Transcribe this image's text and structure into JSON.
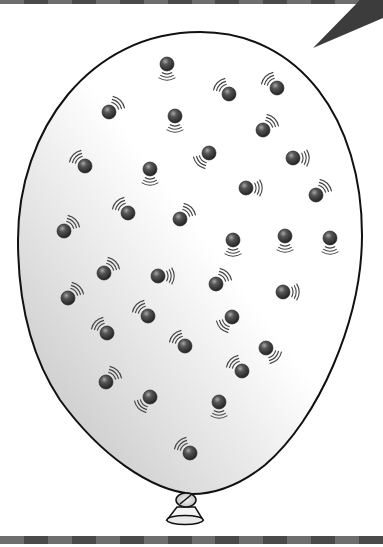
{
  "illustration": {
    "subject": "balloon filled with moving gas particles",
    "colors": {
      "background": "#ffffff",
      "balloon_outline": "#111111",
      "balloon_fill_light": "#ffffff",
      "balloon_fill_shade": "#c9c9c9",
      "particle": "#3a3a3a",
      "particle_highlight": "#9a9a9a",
      "motion_lines": "#444444",
      "pointer_triangle": "#3c3c3c",
      "band_dark": "#4a4a4a",
      "band_mid": "#6e6e6e"
    },
    "particles": [
      {
        "x": 167,
        "y": 64,
        "dir": "down"
      },
      {
        "x": 229,
        "y": 94,
        "dir": "up-left"
      },
      {
        "x": 277,
        "y": 88,
        "dir": "up-left"
      },
      {
        "x": 109,
        "y": 112,
        "dir": "up-right"
      },
      {
        "x": 175,
        "y": 116,
        "dir": "down"
      },
      {
        "x": 263,
        "y": 130,
        "dir": "up-right"
      },
      {
        "x": 85,
        "y": 166,
        "dir": "up-left"
      },
      {
        "x": 150,
        "y": 169,
        "dir": "down"
      },
      {
        "x": 209,
        "y": 153,
        "dir": "down-left"
      },
      {
        "x": 293,
        "y": 158,
        "dir": "right"
      },
      {
        "x": 246,
        "y": 188,
        "dir": "right"
      },
      {
        "x": 316,
        "y": 195,
        "dir": "up-right"
      },
      {
        "x": 128,
        "y": 213,
        "dir": "up-left"
      },
      {
        "x": 180,
        "y": 219,
        "dir": "up-right"
      },
      {
        "x": 64,
        "y": 231,
        "dir": "up-right"
      },
      {
        "x": 233,
        "y": 240,
        "dir": "down"
      },
      {
        "x": 285,
        "y": 236,
        "dir": "down"
      },
      {
        "x": 330,
        "y": 238,
        "dir": "down"
      },
      {
        "x": 104,
        "y": 273,
        "dir": "up-right"
      },
      {
        "x": 158,
        "y": 276,
        "dir": "right"
      },
      {
        "x": 216,
        "y": 284,
        "dir": "up-right"
      },
      {
        "x": 68,
        "y": 298,
        "dir": "up-right"
      },
      {
        "x": 283,
        "y": 292,
        "dir": "right"
      },
      {
        "x": 148,
        "y": 316,
        "dir": "up-left"
      },
      {
        "x": 232,
        "y": 317,
        "dir": "down-left"
      },
      {
        "x": 107,
        "y": 333,
        "dir": "up-left"
      },
      {
        "x": 185,
        "y": 346,
        "dir": "up-left"
      },
      {
        "x": 266,
        "y": 348,
        "dir": "down-right"
      },
      {
        "x": 242,
        "y": 371,
        "dir": "up-left"
      },
      {
        "x": 106,
        "y": 382,
        "dir": "up-right"
      },
      {
        "x": 150,
        "y": 397,
        "dir": "down-left"
      },
      {
        "x": 219,
        "y": 402,
        "dir": "down"
      },
      {
        "x": 190,
        "y": 453,
        "dir": "up-left"
      }
    ],
    "particle_count": 33
  }
}
